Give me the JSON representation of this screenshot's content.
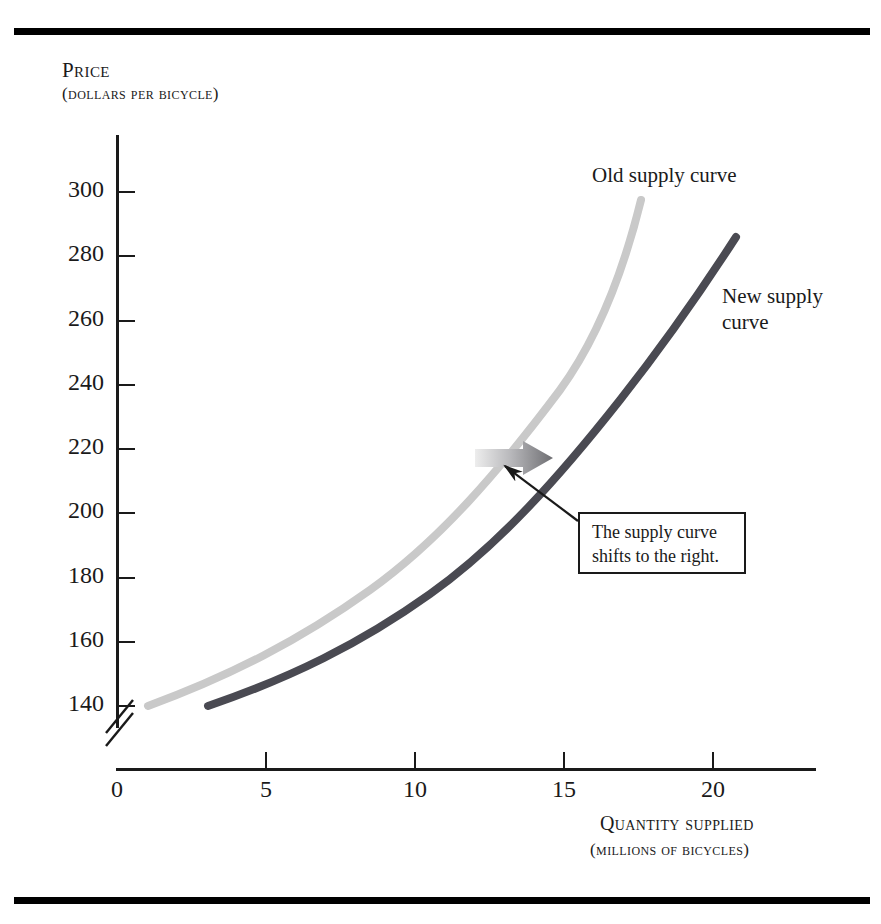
{
  "figure": {
    "background": "#ffffff",
    "rule_color": "#000000"
  },
  "axes": {
    "y_title_main": "Price",
    "y_title_sub": "(dollars per bicycle)",
    "x_title_main": "Quantity supplied",
    "x_title_sub": "(millions of bicycles)",
    "y_ticks": [
      "300",
      "280",
      "260",
      "240",
      "220",
      "200",
      "180",
      "160",
      "140"
    ],
    "x_ticks": [
      "0",
      "5",
      "10",
      "15",
      "20"
    ],
    "has_axis_break": true
  },
  "labels": {
    "old_curve": "Old supply curve",
    "new_curve_line1": "New supply",
    "new_curve_line2": "curve",
    "callout": "The supply curve\nshifts to the right."
  },
  "colors": {
    "old_curve": "#c9c9c9",
    "new_curve": "#4a4a52",
    "axis": "#1a1a1a",
    "arrow_start": "#e8e8e8",
    "arrow_end": "#6e6e72"
  },
  "chart_data": {
    "type": "line",
    "title": "",
    "subtitle": "",
    "xlabel": "Quantity supplied (millions of bicycles)",
    "ylabel": "Price (dollars per bicycle)",
    "xlim": [
      0,
      23.7
    ],
    "ylim": [
      132,
      308
    ],
    "grid": false,
    "legend": "inline-labels",
    "axis_break_y_below": 140,
    "x_tick_values": [
      0,
      5,
      10,
      15,
      20
    ],
    "y_tick_values": [
      140,
      160,
      180,
      200,
      220,
      240,
      260,
      280,
      300
    ],
    "series": [
      {
        "name": "Old supply curve",
        "color": "#c9c9c9",
        "x": [
          1.0,
          3.0,
          5.0,
          7.0,
          9.0,
          11.0,
          13.0,
          15.0,
          16.0,
          17.0
        ],
        "y": [
          140,
          152,
          166,
          181,
          197,
          214,
          235,
          262,
          278,
          300
        ]
      },
      {
        "name": "New supply curve",
        "color": "#4a4a52",
        "x": [
          3.0,
          5.0,
          7.0,
          9.0,
          11.0,
          13.0,
          15.0,
          17.0,
          19.0,
          20.3
        ],
        "y": [
          140,
          151,
          163,
          177,
          192,
          209,
          228,
          250,
          272,
          286
        ]
      }
    ],
    "annotations": [
      {
        "text": "Old supply curve",
        "x": 14.0,
        "y": 302,
        "kind": "series-label"
      },
      {
        "text": "New supply curve",
        "x": 20.6,
        "y": 265,
        "kind": "series-label"
      },
      {
        "text": "The supply curve shifts to the right.",
        "x": 15.6,
        "y": 196,
        "kind": "callout-box",
        "points_to": {
          "x": 13.2,
          "y": 211
        }
      },
      {
        "text": "",
        "kind": "shift-arrow",
        "from": {
          "x": 12.1,
          "y": 219
        },
        "to": {
          "x": 14.7,
          "y": 219
        }
      }
    ]
  }
}
